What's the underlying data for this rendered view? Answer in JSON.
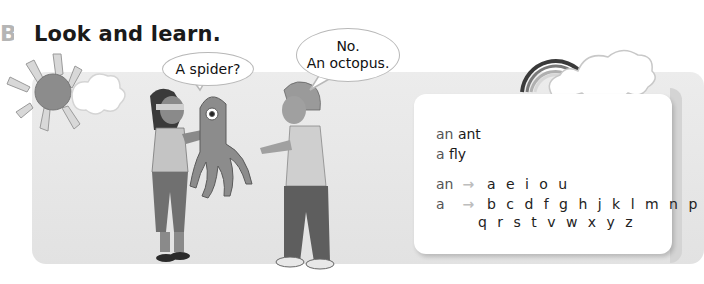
{
  "section": {
    "letter": "B",
    "title": "Look and learn."
  },
  "speech_bubbles": [
    {
      "speaker": "girl",
      "text": "A spider?"
    },
    {
      "speaker": "boy",
      "line1": "No.",
      "line2": "An octopus."
    }
  ],
  "illustration": {
    "sun_icon": "sun-icon",
    "cloud_icon": "cloud-icon",
    "rainbow_icon": "rainbow-icon",
    "characters": [
      "blindfolded-girl",
      "octopus-toy",
      "boy"
    ]
  },
  "grammar_card": {
    "examples": [
      {
        "article": "an",
        "noun": "ant"
      },
      {
        "article": "a",
        "noun": "fly"
      }
    ],
    "rules": [
      {
        "article": "an",
        "arrow": "→",
        "letters": "a e i o u"
      },
      {
        "article": "a",
        "arrow": "→",
        "letters": "b c d f g h j k l m n p",
        "letters2": "q r s t v w x y z"
      }
    ]
  },
  "colors": {
    "panel": "#e6e6e6",
    "card": "#ffffff",
    "arrow": "#bdbdbd",
    "article": "#555555",
    "text": "#1a1a1a"
  }
}
